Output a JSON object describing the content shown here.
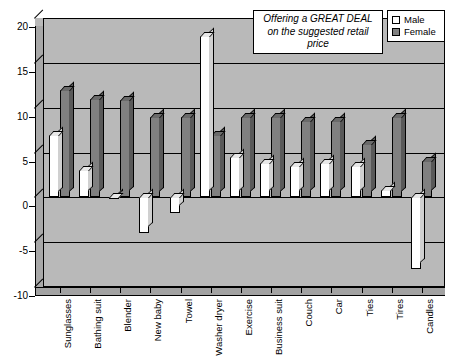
{
  "chart_data": {
    "type": "bar",
    "title": "",
    "xlabel": "",
    "ylabel": "",
    "ylim": [
      -10,
      20
    ],
    "yticks": [
      20,
      15,
      10,
      5,
      0,
      -5,
      -10
    ],
    "grid": true,
    "legend_position": "top-right",
    "categories": [
      "Sunglasses",
      "Bathing suit",
      "Blender",
      "New baby",
      "Towel",
      "Washer dryer",
      "Exercise",
      "Business suit",
      "Couch",
      "Car",
      "Ties",
      "Tires",
      "Candles"
    ],
    "series": [
      {
        "name": "Male",
        "color": "#ffffff",
        "values": [
          7,
          3,
          0,
          -4,
          -1.7,
          18,
          4.5,
          3.8,
          3.5,
          3.8,
          3.5,
          0.8,
          -8
        ]
      },
      {
        "name": "Female",
        "color": "#808080",
        "values": [
          12,
          11,
          10.8,
          9,
          9,
          7,
          9,
          9,
          8.5,
          8.5,
          6,
          9,
          4
        ]
      }
    ],
    "annotations": [
      {
        "text": "Offering a GREAT DEAL on the suggested retail price",
        "style": "italic-box"
      }
    ]
  },
  "legend": {
    "items": [
      {
        "label": "Male",
        "swatch": "male"
      },
      {
        "label": "Female",
        "swatch": "female"
      }
    ]
  },
  "annotation": {
    "text": "Offering a GREAT DEAL on the suggested retail price"
  }
}
